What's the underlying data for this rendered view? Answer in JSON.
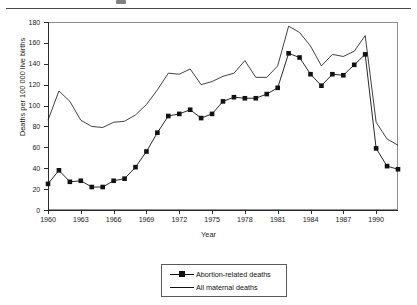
{
  "chart_data": {
    "type": "line",
    "title": "",
    "xlabel": "Year",
    "ylabel": "Deaths per 100 000 live births",
    "xlim": [
      1960,
      1992
    ],
    "ylim": [
      0,
      180
    ],
    "ytick_step": 20,
    "xtick_step": 3,
    "grid": false,
    "legend_position": "below-axes-center",
    "x": [
      1960,
      1961,
      1962,
      1963,
      1964,
      1965,
      1966,
      1967,
      1968,
      1969,
      1970,
      1971,
      1972,
      1973,
      1974,
      1975,
      1976,
      1977,
      1978,
      1979,
      1980,
      1981,
      1982,
      1983,
      1984,
      1985,
      1986,
      1987,
      1988,
      1989,
      1990,
      1991,
      1992
    ],
    "ytick_labels": [
      "0",
      "20",
      "40",
      "60",
      "80",
      "100",
      "120",
      "140",
      "160",
      "180"
    ],
    "xtick_labels": [
      "1960",
      "1963",
      "1966",
      "1969",
      "1972",
      "1975",
      "1978",
      "1981",
      "1984",
      "1987",
      "1990"
    ],
    "series": [
      {
        "name": "Abortion-related deaths",
        "marker": "square",
        "color": "#111111",
        "values": [
          25,
          38,
          27,
          28,
          22,
          22,
          28,
          30,
          41,
          56,
          74,
          90,
          92,
          96,
          88,
          92,
          104,
          108,
          107,
          107,
          111,
          117,
          150,
          146,
          130,
          119,
          130,
          129,
          139,
          149,
          59,
          42,
          39
        ]
      },
      {
        "name": "All maternal deaths",
        "marker": "none",
        "color": "#111111",
        "values": [
          86,
          114,
          104,
          86,
          80,
          79,
          84,
          85,
          91,
          101,
          115,
          131,
          130,
          135,
          120,
          123,
          128,
          131,
          143,
          127,
          127,
          138,
          176,
          170,
          157,
          138,
          149,
          147,
          152,
          167,
          84,
          68,
          62
        ]
      }
    ]
  },
  "legend": {
    "items": [
      {
        "label": "Abortion-related deaths",
        "style": "line-with-square-marker"
      },
      {
        "label": "All maternal deaths",
        "style": "plain-line"
      }
    ]
  },
  "axes": {
    "x_title": "Year",
    "y_title": "Deaths per 100 000 live births"
  }
}
